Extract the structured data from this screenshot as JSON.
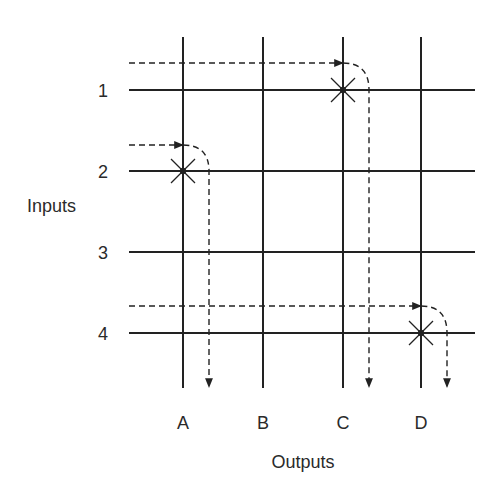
{
  "diagram": {
    "type": "crossbar-switch",
    "axis_labels": {
      "inputs": "Inputs",
      "outputs": "Outputs"
    },
    "inputs": [
      {
        "label": "1",
        "y": 90
      },
      {
        "label": "2",
        "y": 171
      },
      {
        "label": "3",
        "y": 252
      },
      {
        "label": "4",
        "y": 333
      }
    ],
    "outputs": [
      {
        "label": "A",
        "x": 183
      },
      {
        "label": "B",
        "x": 263
      },
      {
        "label": "C",
        "x": 343
      },
      {
        "label": "D",
        "x": 421
      }
    ],
    "connections": [
      {
        "input": "1",
        "output": "C"
      },
      {
        "input": "2",
        "output": "A"
      },
      {
        "input": "4",
        "output": "D"
      }
    ],
    "colors": {
      "line": "#222222",
      "text": "#2a2a2a"
    }
  }
}
